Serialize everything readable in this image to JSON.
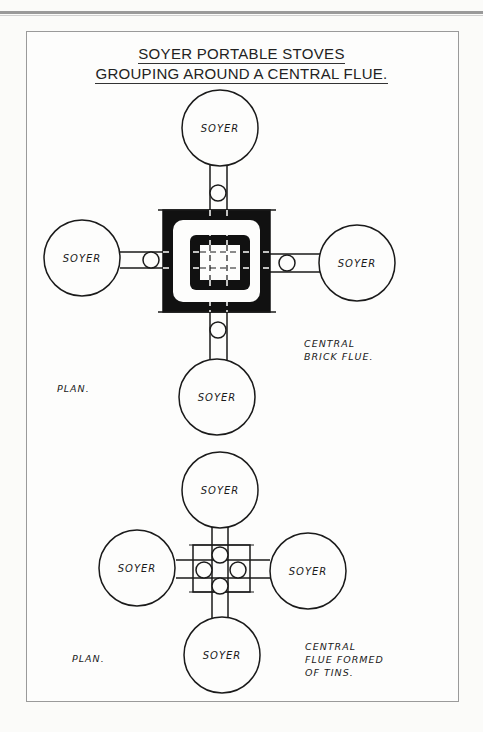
{
  "title": {
    "line1": "SOYER PORTABLE STOVES",
    "line2": "GROUPING AROUND A CENTRAL FLUE."
  },
  "diagram_top": {
    "stoves": [
      "SOYER",
      "SOYER",
      "SOYER",
      "SOYER"
    ],
    "plan_label": "PLAN.",
    "note_line1": "CENTRAL",
    "note_line2": "BRICK FLUE."
  },
  "diagram_bottom": {
    "stoves": [
      "SOYER",
      "SOYER",
      "SOYER",
      "SOYER"
    ],
    "plan_label": "PLAN.",
    "note_line1": "CENTRAL",
    "note_line2": "FLUE FORMED",
    "note_line3": "OF TINS."
  }
}
